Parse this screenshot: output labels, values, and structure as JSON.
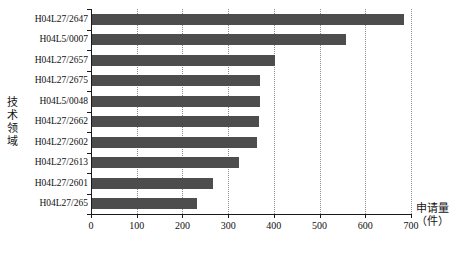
{
  "chart_data": {
    "type": "bar",
    "orientation": "horizontal",
    "title": "",
    "xlabel": "申请量（件）",
    "ylabel": "技术领域",
    "xlim": [
      0,
      700
    ],
    "ylim": null,
    "grid": true,
    "legend": null,
    "bar_color": "#4d4d4d",
    "xticks": [
      0,
      100,
      200,
      300,
      400,
      500,
      600,
      700
    ],
    "categories": [
      "H04L27/2647",
      "H04L5/0007",
      "H04L27/2657",
      "H04L27/2675",
      "H04L5/0048",
      "H04L27/2662",
      "H04L27/2602",
      "H04L27/2613",
      "H04L27/2601",
      "H04L27/265"
    ],
    "values": [
      682,
      555,
      400,
      368,
      368,
      365,
      360,
      322,
      265,
      230
    ]
  },
  "axis": {
    "y_title": "技术领域",
    "x_title_main": "申请量",
    "x_title_unit": "（件）"
  }
}
